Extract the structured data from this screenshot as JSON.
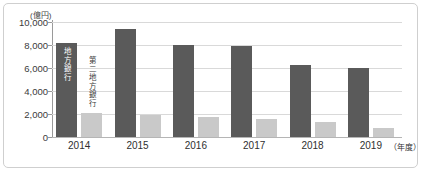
{
  "chart_data": {
    "type": "bar",
    "title": "",
    "subtitle": "",
    "xlabel": "年度",
    "ylabel": "億円",
    "unit_note": "(億円)",
    "xaxis_suffix": "（年度）",
    "categories": [
      "2014",
      "2015",
      "2016",
      "2017",
      "2018",
      "2019"
    ],
    "series": [
      {
        "name": "地方銀行",
        "color": "#5a5a5a",
        "values": [
          8200,
          9400,
          8000,
          7900,
          6250,
          6000
        ]
      },
      {
        "name": "第二地方銀行",
        "color": "#c9c9c9",
        "values": [
          2100,
          1950,
          1750,
          1600,
          1300,
          800
        ]
      }
    ],
    "ylim": [
      0,
      10000
    ],
    "yticks": [
      0,
      2000,
      4000,
      6000,
      8000,
      10000
    ],
    "ytick_labels": [
      "0",
      "2,000",
      "4,000",
      "6,000",
      "8,000",
      "10,000"
    ],
    "grid": true,
    "legend_position": "inline-on-bars-2014",
    "annotations": [
      {
        "text": "地方銀行",
        "target": "2014 dark bar",
        "orientation": "vertical"
      },
      {
        "text": "第二地方銀行",
        "target": "2014 light bar",
        "orientation": "vertical"
      }
    ]
  },
  "colors": {
    "dark_series": "#5a5a5a",
    "light_series": "#c9c9c9",
    "gridline": "#d9d9d9",
    "axis": "#9a9a9a",
    "frame_border": "#cfcfcf",
    "text": "#2f2f2f",
    "background": "#ffffff"
  }
}
